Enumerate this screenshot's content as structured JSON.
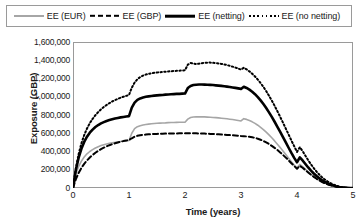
{
  "chart_data": {
    "type": "line",
    "title": "",
    "xlabel": "Time (years)",
    "ylabel": "Exposure (GBP)",
    "xlim": [
      0,
      5
    ],
    "ylim": [
      0,
      1600000
    ],
    "xticks": [
      "0",
      "1",
      "2",
      "3",
      "4",
      "5"
    ],
    "yticks": [
      "0",
      "200,000",
      "400,000",
      "600,000",
      "800,000",
      "1,000,000",
      "1,200,000",
      "1,400,000",
      "1,600,000"
    ],
    "grid": false,
    "legend_position": "top",
    "x": [
      0,
      0.05,
      0.1,
      0.15,
      0.2,
      0.25,
      0.3,
      0.35,
      0.4,
      0.45,
      0.5,
      0.55,
      0.6,
      0.65,
      0.7,
      0.75,
      0.8,
      0.85,
      0.9,
      0.95,
      1,
      1.05,
      1.1,
      1.15,
      1.2,
      1.25,
      1.3,
      1.35,
      1.4,
      1.45,
      1.5,
      1.55,
      1.6,
      1.65,
      1.7,
      1.75,
      1.8,
      1.85,
      1.9,
      1.95,
      2,
      2.05,
      2.1,
      2.15,
      2.2,
      2.25,
      2.3,
      2.35,
      2.4,
      2.45,
      2.5,
      2.55,
      2.6,
      2.65,
      2.7,
      2.75,
      2.8,
      2.85,
      2.9,
      2.95,
      3,
      3.05,
      3.1,
      3.15,
      3.2,
      3.25,
      3.3,
      3.35,
      3.4,
      3.45,
      3.5,
      3.55,
      3.6,
      3.65,
      3.7,
      3.75,
      3.8,
      3.85,
      3.9,
      3.95,
      4,
      4.05,
      4.1,
      4.15,
      4.2,
      4.25,
      4.3,
      4.35,
      4.4,
      4.45,
      4.5,
      4.55,
      4.6,
      4.65,
      4.7,
      4.75,
      4.8,
      4.85,
      4.9,
      4.95,
      5
    ],
    "series": [
      {
        "name": "EE (EUR)",
        "style": "solid",
        "color": "#a6a6a6",
        "width": 1.6,
        "values": [
          0,
          150000,
          235000,
          295000,
          340000,
          375000,
          400000,
          420000,
          438000,
          452000,
          465000,
          475000,
          483000,
          490000,
          496000,
          500000,
          505000,
          509000,
          512000,
          515000,
          520000,
          600000,
          650000,
          672000,
          683000,
          690000,
          696000,
          700000,
          704000,
          707000,
          709000,
          711000,
          713000,
          714000,
          716000,
          717000,
          718000,
          719000,
          720000,
          720000,
          721000,
          755000,
          772000,
          778000,
          780000,
          781000,
          780000,
          779000,
          777000,
          775000,
          773000,
          771000,
          768000,
          765000,
          762000,
          758000,
          754000,
          750000,
          745000,
          740000,
          735000,
          760000,
          752000,
          740000,
          725000,
          708000,
          688000,
          665000,
          640000,
          612000,
          582000,
          550000,
          516000,
          480000,
          443000,
          405000,
          366000,
          327000,
          289000,
          252000,
          218000,
          258000,
          234000,
          205000,
          176000,
          150000,
          126000,
          104000,
          84000,
          67000,
          52000,
          40000,
          30000,
          22000,
          15000,
          10000,
          6000,
          3500,
          1800,
          700,
          0
        ]
      },
      {
        "name": "EE (GBP)",
        "style": "dashed",
        "color": "#000000",
        "width": 2.0,
        "values": [
          0,
          95000,
          165000,
          220000,
          265000,
          302000,
          334000,
          362000,
          386000,
          407000,
          426000,
          442000,
          456000,
          469000,
          480000,
          490000,
          499000,
          507000,
          514000,
          520000,
          526000,
          545000,
          562000,
          572000,
          578000,
          582000,
          585000,
          588000,
          590000,
          592000,
          593000,
          594000,
          595000,
          596000,
          597000,
          597000,
          598000,
          598000,
          599000,
          599000,
          599000,
          600000,
          600000,
          600000,
          599000,
          598000,
          597000,
          596000,
          595000,
          593000,
          592000,
          590000,
          588000,
          586000,
          584000,
          582000,
          580000,
          578000,
          576000,
          573000,
          570000,
          568000,
          565000,
          561000,
          556000,
          549000,
          540000,
          529000,
          516000,
          500000,
          482000,
          462000,
          440000,
          416000,
          390000,
          362000,
          333000,
          303000,
          272000,
          241000,
          211000,
          243000,
          222000,
          196000,
          170000,
          145000,
          122000,
          101000,
          82000,
          65000,
          51000,
          39000,
          29000,
          21000,
          14500,
          9500,
          5800,
          3300,
          1700,
          650,
          0
        ]
      },
      {
        "name": "EE (netting)",
        "style": "solid",
        "color": "#000000",
        "width": 2.6,
        "values": [
          0,
          195000,
          330000,
          430000,
          505000,
          562000,
          606000,
          640000,
          668000,
          690000,
          708000,
          722000,
          735000,
          745000,
          754000,
          762000,
          768000,
          774000,
          779000,
          784000,
          788000,
          880000,
          935000,
          965000,
          982000,
          992000,
          999000,
          1004000,
          1008000,
          1012000,
          1015000,
          1018000,
          1020000,
          1023000,
          1025000,
          1027000,
          1029000,
          1031000,
          1032000,
          1034000,
          1035000,
          1095000,
          1118000,
          1128000,
          1132000,
          1134000,
          1134000,
          1133000,
          1132000,
          1130000,
          1128000,
          1125000,
          1122000,
          1119000,
          1115000,
          1111000,
          1107000,
          1102000,
          1097000,
          1092000,
          1086000,
          1110000,
          1096000,
          1078000,
          1055000,
          1028000,
          996000,
          960000,
          920000,
          876000,
          829000,
          779000,
          726000,
          671000,
          615000,
          557000,
          499000,
          441000,
          384000,
          330000,
          282000,
          335000,
          302000,
          263000,
          225000,
          190000,
          159000,
          131000,
          106000,
          84000,
          66000,
          50000,
          37000,
          27000,
          18000,
          12000,
          7000,
          4000,
          2000,
          800,
          0
        ]
      },
      {
        "name": "EE (no netting)",
        "style": "dotted",
        "color": "#000000",
        "width": 2.0,
        "values": [
          0,
          215000,
          370000,
          490000,
          580000,
          652000,
          710000,
          758000,
          798000,
          832000,
          862000,
          888000,
          910000,
          930000,
          948000,
          963000,
          977000,
          989000,
          1000000,
          1010000,
          1019000,
          1100000,
          1155000,
          1192000,
          1216000,
          1232000,
          1243000,
          1251000,
          1257000,
          1262000,
          1266000,
          1269000,
          1272000,
          1275000,
          1277000,
          1280000,
          1282000,
          1284000,
          1286000,
          1288000,
          1290000,
          1352000,
          1370000,
          1365000,
          1358000,
          1362000,
          1368000,
          1372000,
          1374000,
          1374000,
          1372000,
          1369000,
          1365000,
          1360000,
          1354000,
          1347000,
          1339000,
          1330000,
          1320000,
          1309000,
          1298000,
          1318000,
          1300000,
          1278000,
          1252000,
          1222000,
          1188000,
          1150000,
          1108000,
          1062000,
          1012000,
          958000,
          901000,
          841000,
          779000,
          716000,
          651000,
          586000,
          521000,
          457000,
          395000,
          447000,
          404000,
          354000,
          305000,
          259000,
          217000,
          179000,
          145000,
          116000,
          91000,
          70000,
          53000,
          38000,
          26000,
          17000,
          10000,
          5500,
          2800,
          1000,
          0
        ]
      }
    ]
  },
  "legend": {
    "items": [
      {
        "label": "EE (EUR)",
        "swatch": "solid-gray-line-icon"
      },
      {
        "label": "EE (GBP)",
        "swatch": "dashed-black-line-icon"
      },
      {
        "label": "EE (netting)",
        "swatch": "thick-solid-black-line-icon"
      },
      {
        "label": "EE (no netting)",
        "swatch": "dotted-black-line-icon"
      }
    ]
  }
}
